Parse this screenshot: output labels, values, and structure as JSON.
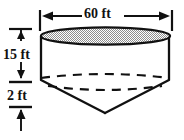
{
  "figure": {
    "colors": {
      "stroke": "#111111",
      "fill_top": "#a8a8a8",
      "background": "#ffffff",
      "hidden_line": "#111111"
    },
    "dimensions": {
      "width": {
        "label": "60 ft",
        "value": 60,
        "unit": "ft",
        "orientation": "horizontal",
        "position": "top",
        "arrow_style": "double-outward"
      },
      "cylinder_height": {
        "label": "15 ft",
        "value": 15,
        "unit": "ft",
        "orientation": "vertical",
        "position": "left-upper",
        "arrow_style": "double-vertical"
      },
      "cone_height": {
        "label": "2 ft",
        "value": 2,
        "unit": "ft",
        "orientation": "vertical",
        "position": "left-lower",
        "arrow_style": "double-vertical"
      }
    },
    "parts": {
      "top_ellipse": "top-opening-ellipse",
      "cylinder_body": "cylinder-wall",
      "cone_body": "cone-bottom",
      "hidden_back_arc_upper": "hidden-rim-arc-upper",
      "hidden_back_arc_lower": "hidden-rim-arc-lower"
    }
  }
}
